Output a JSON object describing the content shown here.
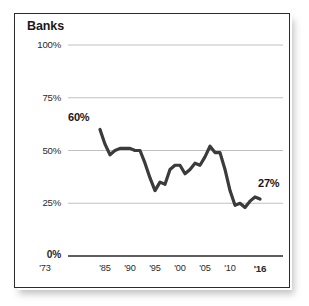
{
  "figure": {
    "title": "Banks",
    "frame_color": "#2b2b2b",
    "background": "#ffffff"
  },
  "axes": {
    "y_ticks": [
      {
        "label": "100%",
        "value": 100,
        "bold": false
      },
      {
        "label": "75%",
        "value": 75,
        "bold": false
      },
      {
        "label": "50%",
        "value": 50,
        "bold": false
      },
      {
        "label": "25%",
        "value": 25,
        "bold": false
      },
      {
        "label": "0%",
        "value": 0,
        "bold": true
      }
    ],
    "x_ticks": [
      {
        "label": "'73",
        "value": 1973,
        "bold": false
      },
      {
        "label": "'85",
        "value": 1985,
        "bold": false
      },
      {
        "label": "'90",
        "value": 1990,
        "bold": false
      },
      {
        "label": "'95",
        "value": 1995,
        "bold": false
      },
      {
        "label": "'00",
        "value": 2000,
        "bold": false
      },
      {
        "label": "'05",
        "value": 2005,
        "bold": false
      },
      {
        "label": "'10",
        "value": 2010,
        "bold": false
      },
      {
        "label": "'16",
        "value": 2016,
        "bold": true
      }
    ]
  },
  "annotations": {
    "start_label": "60%",
    "end_label": "27%"
  },
  "chart_data": {
    "type": "line",
    "title": "Banks",
    "xlabel": "",
    "ylabel": "",
    "xlim": [
      1973,
      2016
    ],
    "ylim": [
      0,
      100
    ],
    "grid": true,
    "legend": false,
    "line_color": "#3b3b3b",
    "line_width": 3.2,
    "units": "percent",
    "annotations": [
      {
        "text": "60%",
        "x": 1984,
        "y": 60
      },
      {
        "text": "27%",
        "x": 2016,
        "y": 27
      }
    ],
    "x": [
      1984,
      1985,
      1986,
      1987,
      1988,
      1989,
      1990,
      1991,
      1992,
      1993,
      1994,
      1995,
      1996,
      1997,
      1998,
      1999,
      2000,
      2001,
      2002,
      2003,
      2004,
      2005,
      2006,
      2007,
      2008,
      2009,
      2010,
      2011,
      2012,
      2013,
      2014,
      2015,
      2016
    ],
    "values": [
      60,
      53,
      48,
      50,
      51,
      51,
      51,
      50,
      50,
      44,
      37,
      31,
      35,
      34,
      41,
      43,
      43,
      39,
      41,
      44,
      43,
      47,
      52,
      49,
      49,
      41,
      31,
      24,
      25,
      23,
      26,
      28,
      27
    ],
    "series": [
      {
        "name": "Banks",
        "values": [
          60,
          53,
          48,
          50,
          51,
          51,
          51,
          50,
          50,
          44,
          37,
          31,
          35,
          34,
          41,
          43,
          43,
          39,
          41,
          44,
          43,
          47,
          52,
          49,
          49,
          41,
          31,
          24,
          25,
          23,
          26,
          28,
          27
        ]
      }
    ]
  }
}
